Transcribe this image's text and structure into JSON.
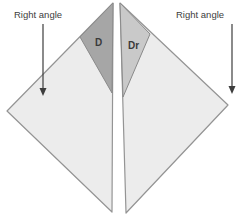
{
  "diagram": {
    "labels": {
      "left_angle": "Right angle",
      "right_angle": "Right angle",
      "d_region": "D",
      "dr_region": "Dr"
    },
    "colors": {
      "background": "#ffffff",
      "light_triangle_fill": "#ececec",
      "d_triangle_fill": "#a6a6a6",
      "dr_triangle_fill": "#c9c9c9",
      "outline": "#949494",
      "text": "#3d3d3d",
      "arrow": "#3d3d3d"
    }
  }
}
